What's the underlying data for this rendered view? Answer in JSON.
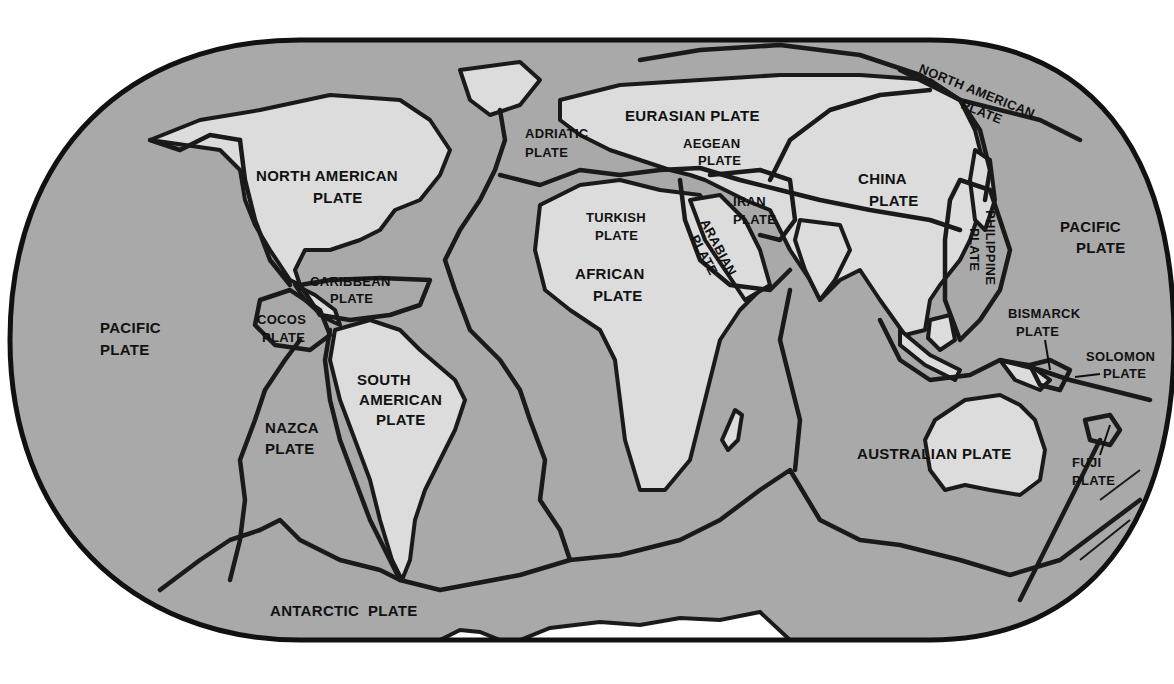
{
  "map": {
    "title": "Tectonic Plates of the World",
    "colors": {
      "ocean": "#a9a9a9",
      "land": "#dcdcdc",
      "boundary": "#1a1a1a",
      "background": "#ffffff"
    },
    "plates": [
      {
        "id": "north-american-plate-top",
        "lines": [
          "NORTH AMERICAN",
          "PLATE"
        ]
      },
      {
        "id": "eurasian-plate",
        "lines": [
          "EURASIAN PLATE"
        ]
      },
      {
        "id": "adriatic-plate",
        "lines": [
          "ADRIATIC",
          "PLATE"
        ]
      },
      {
        "id": "aegean-plate",
        "lines": [
          "AEGEAN",
          "PLATE"
        ]
      },
      {
        "id": "north-american-plate",
        "lines": [
          "NORTH AMERICAN",
          "PLATE"
        ]
      },
      {
        "id": "turkish-plate",
        "lines": [
          "TURKISH",
          "PLATE"
        ]
      },
      {
        "id": "iran-plate",
        "lines": [
          "IRAN",
          "PLATE"
        ]
      },
      {
        "id": "arabian-plate",
        "lines": [
          "ARABIAN",
          "PLATE"
        ]
      },
      {
        "id": "china-plate",
        "lines": [
          "CHINA",
          "PLATE"
        ]
      },
      {
        "id": "philippine-plate",
        "lines": [
          "PHILIPPINE",
          "PLATE"
        ]
      },
      {
        "id": "pacific-plate-east",
        "lines": [
          "PACIFIC",
          "PLATE"
        ]
      },
      {
        "id": "african-plate",
        "lines": [
          "AFRICAN",
          "PLATE"
        ]
      },
      {
        "id": "caribbean-plate",
        "lines": [
          "CARIBBEAN",
          "PLATE"
        ]
      },
      {
        "id": "cocos-plate",
        "lines": [
          "COCOS",
          "PLATE"
        ]
      },
      {
        "id": "pacific-plate-west",
        "lines": [
          "PACIFIC",
          "PLATE"
        ]
      },
      {
        "id": "south-american-plate",
        "lines": [
          "SOUTH",
          "AMERICAN",
          "PLATE"
        ]
      },
      {
        "id": "nazca-plate",
        "lines": [
          "NAZCA",
          "PLATE"
        ]
      },
      {
        "id": "bismarck-plate",
        "lines": [
          "BISMARCK",
          "PLATE"
        ]
      },
      {
        "id": "solomon-plate",
        "lines": [
          "SOLOMON",
          "PLATE"
        ]
      },
      {
        "id": "australian-plate",
        "lines": [
          "AUSTRALIAN PLATE"
        ]
      },
      {
        "id": "fuji-plate",
        "lines": [
          "FUJI",
          "PLATE"
        ]
      },
      {
        "id": "antarctic-plate",
        "lines": [
          "ANTARCTIC  PLATE"
        ]
      }
    ]
  }
}
